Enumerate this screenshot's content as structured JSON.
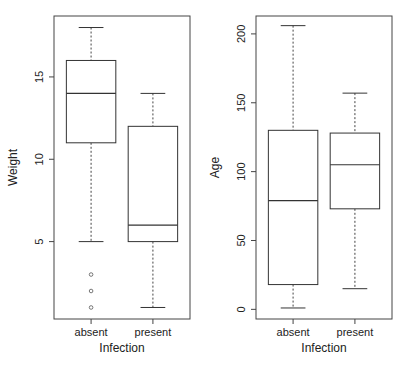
{
  "chart_data": [
    {
      "type": "boxplot",
      "title": "",
      "xlabel": "Infection",
      "ylabel": "Weight",
      "categories": [
        "absent",
        "present"
      ],
      "yticks": [
        5,
        10,
        15
      ],
      "ylim": [
        0.3,
        18.7
      ],
      "grid": false,
      "series": [
        {
          "name": "absent",
          "whisker_low": 5,
          "q1": 11,
          "median": 14,
          "q3": 16,
          "whisker_high": 18,
          "outliers": [
            3,
            2,
            1
          ]
        },
        {
          "name": "present",
          "whisker_low": 1,
          "q1": 5,
          "median": 6,
          "q3": 12,
          "whisker_high": 14,
          "outliers": []
        }
      ]
    },
    {
      "type": "boxplot",
      "title": "",
      "xlabel": "Infection",
      "ylabel": "Age",
      "categories": [
        "absent",
        "present"
      ],
      "yticks": [
        0,
        50,
        100,
        150,
        200
      ],
      "ylim": [
        -7,
        213
      ],
      "grid": false,
      "series": [
        {
          "name": "absent",
          "whisker_low": 1,
          "q1": 18,
          "median": 79,
          "q3": 130,
          "whisker_high": 206,
          "outliers": []
        },
        {
          "name": "present",
          "whisker_low": 15,
          "q1": 73,
          "median": 105,
          "q3": 128,
          "whisker_high": 157,
          "outliers": []
        }
      ]
    }
  ]
}
